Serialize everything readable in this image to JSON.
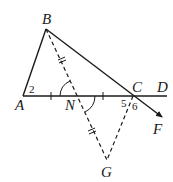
{
  "diagram": {
    "type": "geometry",
    "points": {
      "A": {
        "label": "A"
      },
      "B": {
        "label": "B"
      },
      "C": {
        "label": "C"
      },
      "D": {
        "label": "D"
      },
      "F": {
        "label": "F"
      },
      "G": {
        "label": "G"
      },
      "N": {
        "label": "N"
      }
    },
    "angle_labels": {
      "angle2": "2",
      "angle5": "5",
      "angle6": "6"
    },
    "segments": {
      "solid": [
        "AB",
        "BC",
        "AD",
        "CF"
      ],
      "dashed": [
        "BG",
        "CG"
      ]
    },
    "markings": {
      "single_tick": [
        "AN",
        "NC"
      ],
      "double_tick": [
        "BN",
        "NG"
      ],
      "vertical_angles_arcs": [
        "BNA",
        "CNG"
      ]
    },
    "colors": {
      "stroke": "#1a1a1a",
      "background": "#ffffff"
    }
  }
}
